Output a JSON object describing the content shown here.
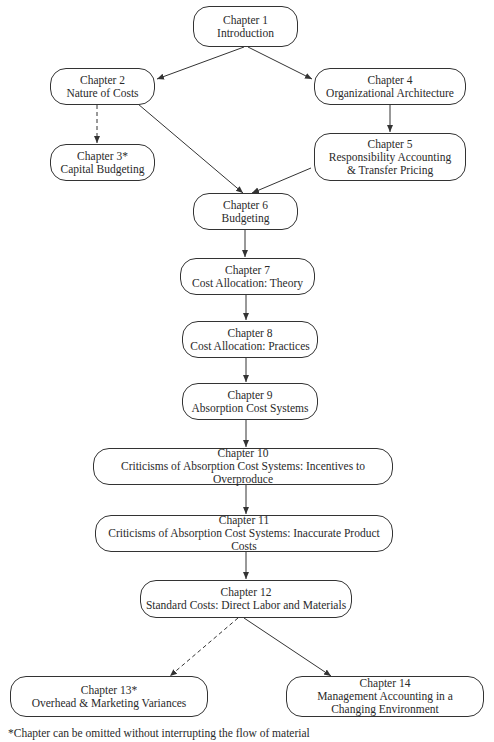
{
  "diagram": {
    "nodes": [
      {
        "id": "ch1",
        "chapter": "Chapter 1",
        "title": "Introduction",
        "optional": false
      },
      {
        "id": "ch2",
        "chapter": "Chapter 2",
        "title": "Nature of Costs",
        "optional": false
      },
      {
        "id": "ch3",
        "chapter": "Chapter 3*",
        "title": "Capital Budgeting",
        "optional": true
      },
      {
        "id": "ch4",
        "chapter": "Chapter 4",
        "title": "Organizational Architecture",
        "optional": false
      },
      {
        "id": "ch5",
        "chapter": "Chapter 5",
        "title": "Responsibility Accounting",
        "title2": "& Transfer Pricing",
        "optional": false
      },
      {
        "id": "ch6",
        "chapter": "Chapter 6",
        "title": "Budgeting",
        "optional": false
      },
      {
        "id": "ch7",
        "chapter": "Chapter 7",
        "title": "Cost Allocation: Theory",
        "optional": false
      },
      {
        "id": "ch8",
        "chapter": "Chapter 8",
        "title": "Cost Allocation: Practices",
        "optional": false
      },
      {
        "id": "ch9",
        "chapter": "Chapter 9",
        "title": "Absorption Cost Systems",
        "optional": false
      },
      {
        "id": "ch10",
        "chapter": "Chapter 10",
        "title": "Criticisms of Absorption Cost Systems: Incentives to Overproduce",
        "optional": false
      },
      {
        "id": "ch11",
        "chapter": "Chapter 11",
        "title": "Criticisms of Absorption Cost Systems: Inaccurate Product Costs",
        "optional": false
      },
      {
        "id": "ch12",
        "chapter": "Chapter 12",
        "title": "Standard Costs: Direct Labor and Materials",
        "optional": false
      },
      {
        "id": "ch13",
        "chapter": "Chapter 13*",
        "title": "Overhead & Marketing Variances",
        "optional": true
      },
      {
        "id": "ch14",
        "chapter": "Chapter 14",
        "title": "Management Accounting in a",
        "title2": "Changing Environment",
        "optional": false
      }
    ],
    "edges": [
      {
        "from": "ch1",
        "to": "ch2",
        "style": "solid"
      },
      {
        "from": "ch1",
        "to": "ch4",
        "style": "solid"
      },
      {
        "from": "ch2",
        "to": "ch3",
        "style": "dashed"
      },
      {
        "from": "ch2",
        "to": "ch6",
        "style": "solid"
      },
      {
        "from": "ch4",
        "to": "ch5",
        "style": "solid"
      },
      {
        "from": "ch5",
        "to": "ch6",
        "style": "solid"
      },
      {
        "from": "ch6",
        "to": "ch7",
        "style": "solid"
      },
      {
        "from": "ch7",
        "to": "ch8",
        "style": "solid"
      },
      {
        "from": "ch8",
        "to": "ch9",
        "style": "solid"
      },
      {
        "from": "ch9",
        "to": "ch10",
        "style": "solid"
      },
      {
        "from": "ch10",
        "to": "ch11",
        "style": "solid"
      },
      {
        "from": "ch11",
        "to": "ch12",
        "style": "solid"
      },
      {
        "from": "ch12",
        "to": "ch13",
        "style": "dashed"
      },
      {
        "from": "ch12",
        "to": "ch14",
        "style": "solid"
      }
    ],
    "footnote": "*Chapter can be omitted without interrupting the flow of material"
  }
}
